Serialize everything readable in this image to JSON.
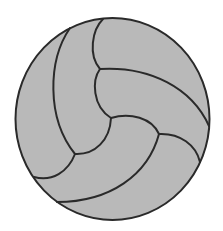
{
  "image": {
    "subject": "volleyball",
    "icon": "volleyball-icon",
    "colors": {
      "background": "#ffffff",
      "fill": "#b9b9b9",
      "stroke": "#2a2a2a"
    }
  }
}
